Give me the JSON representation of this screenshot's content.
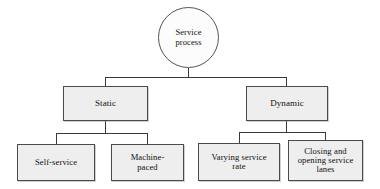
{
  "diagram": {
    "type": "hierarchy-tree",
    "background_color": "#ffffff",
    "node_fill_color": "#eeeeee",
    "node_border_color": "#4a4a4a",
    "root_fill_color": "#fcfcfc",
    "connector_color": "#3a3a3a",
    "root": {
      "id": "service-process",
      "label": "Service\nprocess",
      "line1": "Service",
      "line2": "process",
      "shape": "circle"
    },
    "level2": [
      {
        "id": "static",
        "label": "Static",
        "shape": "rectangle",
        "parent": "service-process"
      },
      {
        "id": "dynamic",
        "label": "Dynamic",
        "shape": "rectangle",
        "parent": "service-process"
      }
    ],
    "level3": [
      {
        "id": "self-service",
        "label": "Self-service",
        "line1": "Self-service",
        "line2": "",
        "line3": "",
        "shape": "rectangle",
        "parent": "static"
      },
      {
        "id": "machine-paced",
        "label": "Machine-paced",
        "line1": "Machine-",
        "line2": "paced",
        "line3": "",
        "shape": "rectangle",
        "parent": "static"
      },
      {
        "id": "varying-service-rate",
        "label": "Varying service rate",
        "line1": "Varying service",
        "line2": "rate",
        "line3": "",
        "shape": "rectangle",
        "parent": "dynamic"
      },
      {
        "id": "closing-and-opening-service-lanes",
        "label": "Closing and opening service lanes",
        "line1": "Closing and",
        "line2": "opening service",
        "line3": "lanes",
        "shape": "rectangle",
        "parent": "dynamic"
      }
    ]
  }
}
